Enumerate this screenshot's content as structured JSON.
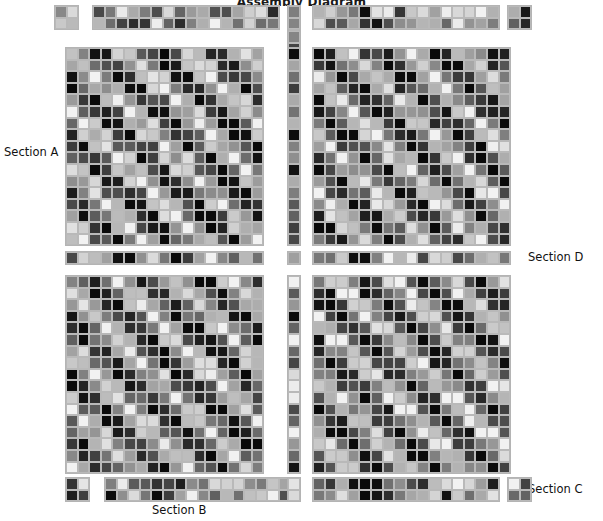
{
  "title": "Assembly Diagram",
  "labels": {
    "section_a": "Section A",
    "section_b": "Section B",
    "section_c": "Section C",
    "section_d": "Section D"
  },
  "colors": {
    "background": "#ffffff",
    "grid_border": "#b9b9b9",
    "block_outline": "#b4b4b4",
    "text": "#111111",
    "palette_min": "#0a0a0a",
    "palette_max": "#f2f2f2"
  },
  "chart_data": {
    "type": "heatmap",
    "title": "Assembly Diagram",
    "xlabel": "",
    "ylabel": "",
    "grid": true,
    "legend": false,
    "colormap": "grayscale",
    "value_range": [
      0,
      1
    ],
    "cell_size_px": 11.6,
    "blocks": [
      {
        "name": "top-left-corner",
        "x": 55,
        "y": 6,
        "cols": 2,
        "rows": 2,
        "kind": "corner",
        "seed": 11
      },
      {
        "name": "top-strip-left",
        "x": 93,
        "y": 6,
        "cols": 16,
        "rows": 2,
        "kind": "strip",
        "seed": 23
      },
      {
        "name": "top-center-strip",
        "x": 288,
        "y": 6,
        "cols": 1,
        "rows": 2,
        "kind": "strip",
        "seed": 31
      },
      {
        "name": "top-strip-right",
        "x": 313,
        "y": 6,
        "cols": 16,
        "rows": 2,
        "kind": "strip",
        "seed": 47
      },
      {
        "name": "top-right-corner",
        "x": 508,
        "y": 6,
        "cols": 2,
        "rows": 2,
        "kind": "corner",
        "seed": 53
      },
      {
        "name": "left-center-col-top",
        "x": 288,
        "y": 31,
        "cols": 1,
        "rows": 17,
        "kind": "strip",
        "seed": 61
      },
      {
        "name": "quadrant-top-left",
        "x": 66,
        "y": 48,
        "cols": 17,
        "rows": 17,
        "kind": "diag",
        "seed": 7,
        "slope": 1.0,
        "period": 5.0,
        "phase": 0.0
      },
      {
        "name": "quadrant-top-right",
        "x": 313,
        "y": 48,
        "cols": 17,
        "rows": 17,
        "kind": "diag",
        "seed": 13,
        "slope": 1.0,
        "period": 5.0,
        "phase": 0.45
      },
      {
        "name": "center-col-mid",
        "x": 288,
        "y": 48,
        "cols": 1,
        "rows": 17,
        "kind": "strip",
        "seed": 67
      },
      {
        "name": "mid-strip-left",
        "x": 66,
        "y": 252,
        "cols": 17,
        "rows": 1,
        "kind": "strip",
        "seed": 71
      },
      {
        "name": "mid-center-cell",
        "x": 288,
        "y": 252,
        "cols": 1,
        "rows": 1,
        "kind": "strip",
        "seed": 73
      },
      {
        "name": "mid-strip-right",
        "x": 313,
        "y": 252,
        "cols": 17,
        "rows": 1,
        "kind": "strip",
        "seed": 79
      },
      {
        "name": "quadrant-bottom-left",
        "x": 66,
        "y": 276,
        "cols": 17,
        "rows": 17,
        "kind": "diag",
        "seed": 17,
        "slope": 1.0,
        "period": 5.0,
        "phase": 0.2
      },
      {
        "name": "quadrant-bottom-right",
        "x": 313,
        "y": 276,
        "cols": 17,
        "rows": 17,
        "kind": "diag",
        "seed": 19,
        "slope": 1.0,
        "period": 5.0,
        "phase": 0.7
      },
      {
        "name": "center-col-bottom",
        "x": 288,
        "y": 276,
        "cols": 1,
        "rows": 17,
        "kind": "strip",
        "seed": 83
      },
      {
        "name": "bottom-left-corner",
        "x": 66,
        "y": 478,
        "cols": 2,
        "rows": 2,
        "kind": "corner",
        "seed": 89
      },
      {
        "name": "bottom-strip-left",
        "x": 105,
        "y": 478,
        "cols": 16,
        "rows": 2,
        "kind": "strip",
        "seed": 97
      },
      {
        "name": "bottom-center-strip",
        "x": 288,
        "y": 478,
        "cols": 1,
        "rows": 2,
        "kind": "strip",
        "seed": 101
      },
      {
        "name": "bottom-strip-right",
        "x": 313,
        "y": 478,
        "cols": 16,
        "rows": 2,
        "kind": "strip",
        "seed": 103
      },
      {
        "name": "bottom-right-corner",
        "x": 508,
        "y": 478,
        "cols": 2,
        "rows": 2,
        "kind": "corner",
        "seed": 107
      }
    ]
  }
}
